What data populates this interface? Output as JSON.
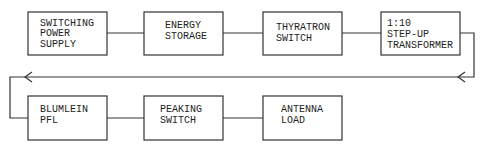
{
  "diagram": {
    "type": "block-diagram",
    "colors": {
      "line": "#333333",
      "text": "#222222",
      "background": "#ffffff"
    },
    "blocks": [
      {
        "id": "b1",
        "lines": [
          "SWITCHING",
          "POWER",
          "SUPPLY"
        ]
      },
      {
        "id": "b2",
        "lines": [
          "ENERGY",
          "STORAGE"
        ]
      },
      {
        "id": "b3",
        "lines": [
          "THYRATRON",
          "SWITCH"
        ]
      },
      {
        "id": "b4",
        "lines": [
          "1:10",
          "STEP-UP",
          "TRANSFORMER"
        ]
      },
      {
        "id": "b5",
        "lines": [
          "BLUMLEIN",
          "PFL"
        ]
      },
      {
        "id": "b6",
        "lines": [
          "PEAKING",
          "SWITCH"
        ]
      },
      {
        "id": "b7",
        "lines": [
          "ANTENNA",
          "LOAD"
        ]
      }
    ],
    "connections": [
      {
        "from": "b1",
        "to": "b2"
      },
      {
        "from": "b2",
        "to": "b3"
      },
      {
        "from": "b3",
        "to": "b4"
      },
      {
        "from": "b4",
        "to": "b5",
        "routing": "return-line-right-to-left",
        "arrows": 2
      },
      {
        "from": "b5",
        "to": "b6"
      },
      {
        "from": "b6",
        "to": "b7"
      }
    ]
  }
}
